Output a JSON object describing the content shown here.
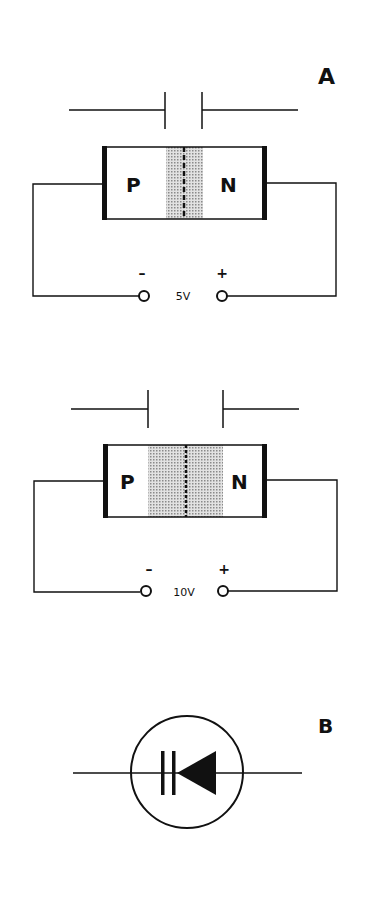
{
  "figure": {
    "panel_a": {
      "label": "A",
      "circuits": [
        {
          "p_label": "P",
          "n_label": "N",
          "voltage": "5V",
          "neg": "–",
          "pos": "+",
          "depletion": "narrow"
        },
        {
          "p_label": "P",
          "n_label": "N",
          "voltage": "10V",
          "neg": "–",
          "pos": "+",
          "depletion": "wide"
        }
      ]
    },
    "panel_b": {
      "label": "B",
      "symbol": "varactor-diode-symbol"
    }
  },
  "colors": {
    "ink": "#111111",
    "shade": "#bdbdbd",
    "background": "#ffffff"
  }
}
